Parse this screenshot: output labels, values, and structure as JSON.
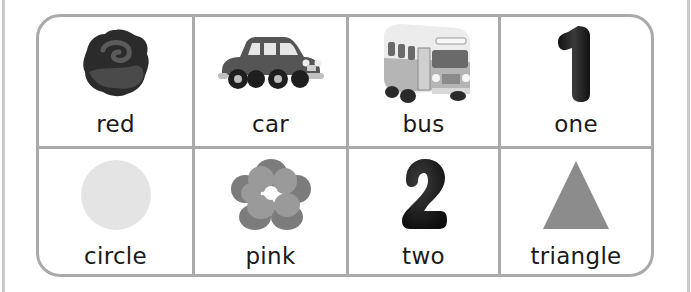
{
  "chart": {
    "rows": [
      [
        {
          "word": "red",
          "icon": "rose-icon"
        },
        {
          "word": "car",
          "icon": "car-icon"
        },
        {
          "word": "bus",
          "icon": "bus-icon"
        },
        {
          "word": "one",
          "icon": "number-one-icon",
          "glyph": "1"
        }
      ],
      [
        {
          "word": "circle",
          "icon": "circle-icon"
        },
        {
          "word": "pink",
          "icon": "flower-icon"
        },
        {
          "word": "two",
          "icon": "number-two-icon",
          "glyph": "2"
        },
        {
          "word": "triangle",
          "icon": "triangle-icon"
        }
      ]
    ]
  },
  "colors": {
    "border": "#aaaaaa",
    "rose": "#2b2b2b",
    "car": "#555555",
    "bus": "#bdbdbd",
    "numbers": "#222222",
    "circle": "#e4e4e4",
    "flower": "#8a8a8a",
    "triangle": "#8c8c8c"
  }
}
